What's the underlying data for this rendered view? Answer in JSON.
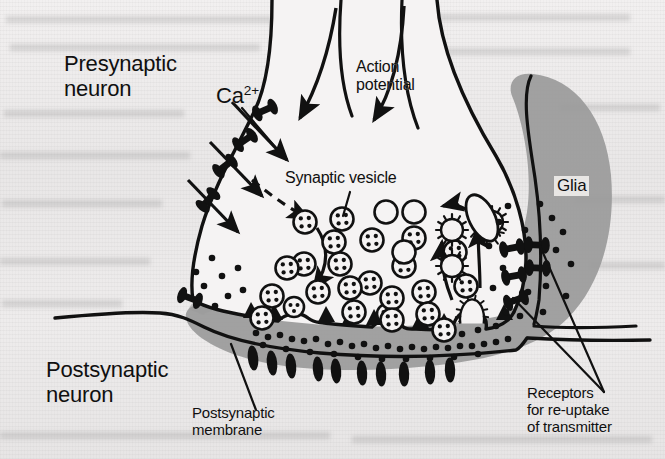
{
  "figure": {
    "background_color": "#eceaea",
    "ink_color": "#111111",
    "glia_fill_color": "#9a9a9a",
    "cytoplasm_fill_color": "#f4f2f2"
  },
  "labels": {
    "presynaptic_neuron": "Presynaptic\nneuron",
    "calcium_ion": "Ca",
    "calcium_ion_charge": "2+",
    "action_potential": "Action\npotential",
    "synaptic_vesicle": "Synaptic vesicle",
    "glia": "Glia",
    "postsynaptic_neuron": "Postsynaptic\nneuron",
    "postsynaptic_membrane": "Postsynaptic\nmembrane",
    "receptors_reuptake": "Receptors\nfor re-uptake\nof transmitter"
  },
  "structures": {
    "calcium_channels_count": 4,
    "calcium_influx_arrows": 3,
    "action_potential_arrows": 2,
    "filled_vesicles_count": 22,
    "empty_vesicles_count": 3,
    "coated_vesicles_count": 3,
    "endosome_count": 1,
    "active_zone_densities": 9,
    "postsynaptic_receptors_count": 10,
    "reuptake_receptors_count": 6,
    "transmitter_dots_count": 54,
    "recycling_arrows": 3,
    "exocytosis_omega_profiles": 3
  },
  "leader_lines": {
    "synaptic_vesicle_to_vesicle": true,
    "postsynaptic_membrane_to_membrane": true,
    "receptors_two_leaders": true
  }
}
